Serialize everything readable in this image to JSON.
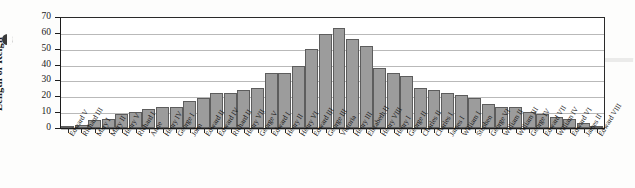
{
  "figure": {
    "ylabel": "Length of Reign",
    "margin_mark": "page-bullet-mark",
    "scan_artifact": "page-corner-artifact"
  },
  "chart_data": {
    "type": "bar",
    "title": "",
    "subtitle": "",
    "xlabel": "",
    "ylabel": "Length of Reign",
    "ylim": [
      0,
      70
    ],
    "yticks": [
      0,
      10,
      20,
      30,
      40,
      50,
      60,
      70
    ],
    "grid": true,
    "legend": false,
    "legend_position": "none",
    "bar_color": "#9c9c9c",
    "bar_edge_color": "#5d5d5d",
    "sorted": "ascending by value",
    "categories": [
      "Edward V",
      "Richard III",
      "Mary I",
      "Mary II",
      "Henry V",
      "Richard I",
      "Anne",
      "Henry IV",
      "George I",
      "John",
      "Edward II",
      "Edward IV",
      "Richard II",
      "Henry VII",
      "George V",
      "Edward I",
      "Henry II",
      "Henry VI",
      "Edward III",
      "George III",
      "Victoria",
      "Henry III",
      "Elizabeth II",
      "Henry VIII",
      "Henry I",
      "George II",
      "Charles II",
      "Charles I",
      "James I",
      "William I",
      "Stephen",
      "George VI",
      "William II",
      "William III",
      "George IV",
      "Edward VII",
      "William IV",
      "Edward VI",
      "James II",
      "Edward VIII"
    ],
    "values": [
      0,
      2,
      5,
      6,
      9,
      10,
      12,
      13,
      13,
      17,
      19,
      22,
      22,
      24,
      25,
      35,
      35,
      39,
      50,
      59,
      63,
      56,
      52,
      38,
      35,
      33,
      25,
      24,
      22,
      21,
      19,
      15,
      13,
      13,
      10,
      9,
      7,
      6,
      3,
      1
    ]
  },
  "yticks_text": [
    "70",
    "60",
    "50",
    "40",
    "30",
    "20",
    "10",
    "0"
  ]
}
